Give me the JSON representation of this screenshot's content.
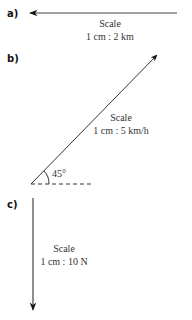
{
  "diagrams": [
    {
      "label": "a)",
      "direction": "left (west)",
      "scale_title": "Scale",
      "scale_value": "1 cm : 2 km"
    },
    {
      "label": "b)",
      "direction": "45° above horizontal (north-east)",
      "angle_label": "45°",
      "scale_title": "Scale",
      "scale_value": "1 cm : 5 km/h"
    },
    {
      "label": "c)",
      "direction": "down (south)",
      "scale_title": "Scale",
      "scale_value": "1 cm : 10 N"
    }
  ],
  "colors": {
    "arrow": "#111111",
    "text": "#333333",
    "background": "#ffffff"
  }
}
